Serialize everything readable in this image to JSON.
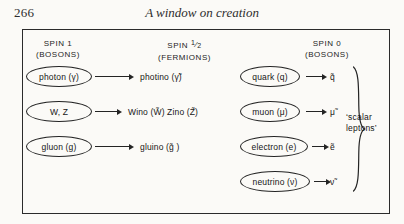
{
  "page": {
    "folio": "266",
    "running_head": "A window on creation"
  },
  "figure": {
    "columns": [
      {
        "name": "spin-1",
        "line1": "SPIN 1",
        "line2": "(BOSONS)"
      },
      {
        "name": "spin-half",
        "line1_prefix": "SPIN ",
        "line1_num": "1",
        "line1_den": "2",
        "line2": "(FERMIONS)"
      },
      {
        "name": "spin-0",
        "line1": "SPIN 0",
        "line2": "(BOSONS)"
      }
    ],
    "rows": [
      {
        "left_particle": "photon (γ)",
        "left_partner": "photino (γ̃)",
        "right_particle": "quark (q)",
        "right_partner": "q̃"
      },
      {
        "left_particle": "W, Z",
        "left_partner": "Wino (W̃)  Zino (Z̃)",
        "right_particle": "muon (μ)",
        "right_partner": "μ̃"
      },
      {
        "left_particle": "gluon (g)",
        "left_partner": "gluino  (g̃ )",
        "right_particle": "electron (e)",
        "right_partner": "ẽ"
      },
      {
        "left_particle": "",
        "left_partner": "",
        "right_particle": "neutrino (ν)",
        "right_partner": "ν̃"
      }
    ],
    "brace_label_line1": "‘scalar",
    "brace_label_line2": "leptons’",
    "ink_color": "#242424",
    "paper_color": "#fbfaf7"
  }
}
